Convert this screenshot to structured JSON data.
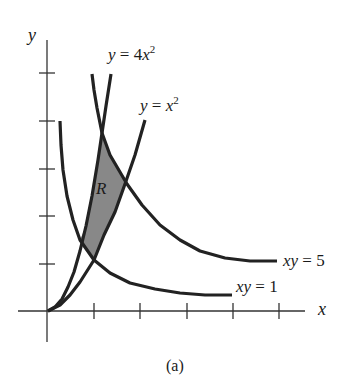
{
  "figure": {
    "caption": "(a)",
    "axis_x_label": "x",
    "axis_y_label": "y",
    "region_label": "R",
    "colors": {
      "curve": "#222222",
      "axis": "#333333",
      "shade": "#888888"
    },
    "labels": {
      "curve_4x2": {
        "lhs": "y",
        "eq": " = 4",
        "var": "x",
        "exp": "2"
      },
      "curve_x2": {
        "lhs": "y",
        "eq": " = ",
        "var": "x",
        "exp": "2"
      },
      "curve_xy5": {
        "lhs": "xy",
        "eq": " = 5"
      },
      "curve_xy1": {
        "lhs": "xy",
        "eq": " = 1"
      }
    },
    "axes": {
      "origin": [
        48,
        311
      ],
      "x_axis": [
        18,
        311,
        305,
        311
      ],
      "y_axis": [
        47,
        40,
        47,
        342
      ],
      "x_ticks": [
        94,
        140,
        187,
        233,
        279
      ],
      "y_ticks": [
        264,
        216,
        169,
        121,
        73
      ]
    },
    "curves": {
      "y_eq_4x2": [
        [
          48,
          311
        ],
        [
          55,
          307
        ],
        [
          62,
          299
        ],
        [
          68,
          287
        ],
        [
          74,
          272
        ],
        [
          80,
          251
        ],
        [
          86,
          226
        ],
        [
          92,
          196
        ],
        [
          98,
          160
        ],
        [
          102,
          133
        ],
        [
          106,
          106
        ],
        [
          111,
          74
        ]
      ],
      "y_eq_x2": [
        [
          48,
          311
        ],
        [
          60,
          305
        ],
        [
          70,
          295
        ],
        [
          80,
          282
        ],
        [
          94,
          260
        ],
        [
          104,
          235
        ],
        [
          115,
          212
        ],
        [
          125,
          184
        ],
        [
          135,
          155
        ],
        [
          145,
          120
        ]
      ],
      "xy_eq_5": [
        [
          92,
          74
        ],
        [
          94,
          90
        ],
        [
          97,
          108
        ],
        [
          102,
          133
        ],
        [
          110,
          155
        ],
        [
          127,
          184
        ],
        [
          142,
          205
        ],
        [
          160,
          225
        ],
        [
          180,
          240
        ],
        [
          200,
          251
        ],
        [
          225,
          258
        ],
        [
          250,
          261
        ],
        [
          277,
          261
        ]
      ],
      "xy_eq_1": [
        [
          60,
          121
        ],
        [
          61,
          145
        ],
        [
          63,
          170
        ],
        [
          67,
          196
        ],
        [
          73,
          220
        ],
        [
          80,
          240
        ],
        [
          94,
          260
        ],
        [
          110,
          273
        ],
        [
          130,
          283
        ],
        [
          155,
          289
        ],
        [
          180,
          293
        ],
        [
          205,
          295
        ],
        [
          232,
          295
        ]
      ]
    },
    "region_R": [
      [
        102,
        133
      ],
      [
        110,
        155
      ],
      [
        125,
        182
      ],
      [
        115,
        212
      ],
      [
        104,
        235
      ],
      [
        94,
        260
      ],
      [
        80,
        240
      ],
      [
        86,
        226
      ],
      [
        92,
        196
      ],
      [
        98,
        160
      ]
    ]
  }
}
